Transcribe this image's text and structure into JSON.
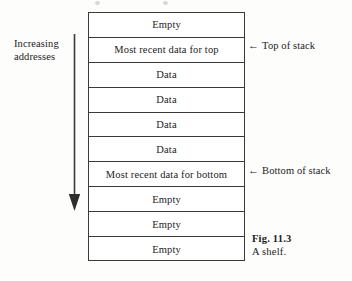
{
  "figure": {
    "caption_number": "Fig. 11.3",
    "caption_text": "A shelf.",
    "left_annotation": {
      "line1": "Increasing",
      "line2": "addresses",
      "arrow_icon": "down-arrow-icon",
      "direction": "down"
    },
    "rows": [
      {
        "label": "Empty"
      },
      {
        "label": "Most recent data for top"
      },
      {
        "label": "Data"
      },
      {
        "label": "Data"
      },
      {
        "label": "Data"
      },
      {
        "label": "Data"
      },
      {
        "label": "Most recent data for bottom"
      },
      {
        "label": "Empty"
      },
      {
        "label": "Empty"
      },
      {
        "label": "Empty"
      }
    ],
    "pointers": [
      {
        "arrow_glyph": "←",
        "icon": "left-arrow-icon",
        "label": "Top of stack",
        "row_index": 1
      },
      {
        "arrow_glyph": "←",
        "icon": "left-arrow-icon",
        "label": "Bottom of stack",
        "row_index": 6
      }
    ],
    "colors": {
      "ink": "#232323",
      "rule": "#3a3a3a",
      "paper": "#fdfdfc",
      "cell_fill": "#ffffff"
    }
  }
}
